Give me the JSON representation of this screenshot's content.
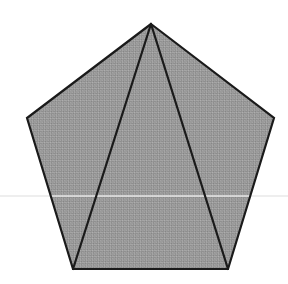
{
  "canvas": {
    "width": 288,
    "height": 284,
    "background_color": "#ffffff",
    "alt_text": "Regular pentagon shaded gray, divided by two diagonals from the top vertex into three triangles"
  },
  "figure": {
    "name": "pentagon",
    "type": "regular-pentagon",
    "sides": 5,
    "fill_color": "#999999",
    "fill_texture": "dithered-gray-halftone",
    "stroke_color": "#1a1a1a",
    "stroke_width": 2.2,
    "vertices": [
      {
        "label": "apex",
        "x": 151,
        "y": 24
      },
      {
        "label": "upper-right",
        "x": 274,
        "y": 118
      },
      {
        "label": "bottom-right",
        "x": 228,
        "y": 269
      },
      {
        "label": "bottom-left",
        "x": 73,
        "y": 269
      },
      {
        "label": "upper-left",
        "x": 27,
        "y": 118
      }
    ],
    "points_attr": "151,24 274,118 228,269 73,269 27,118"
  },
  "diagonals": [
    {
      "name": "apex-to-bottom-left",
      "x1": 151,
      "y1": 24,
      "x2": 73,
      "y2": 269,
      "stroke_color": "#1a1a1a",
      "stroke_width": 2.2
    },
    {
      "name": "apex-to-bottom-right",
      "x1": 151,
      "y1": 24,
      "x2": 228,
      "y2": 269,
      "stroke_color": "#1a1a1a",
      "stroke_width": 2.2
    }
  ],
  "regions": [
    {
      "name": "left-triangle",
      "vertices": "151,24 73,269 27,118"
    },
    {
      "name": "center-triangle",
      "vertices": "151,24 228,269 73,269"
    },
    {
      "name": "right-triangle",
      "vertices": "151,24 274,118 228,269"
    }
  ],
  "artifacts": {
    "scanline": {
      "name": "horizontal-scan-artifact",
      "y": 196,
      "x1": 0,
      "x2": 288,
      "color": "#e8e8e8",
      "stroke_width": 1.4
    }
  }
}
